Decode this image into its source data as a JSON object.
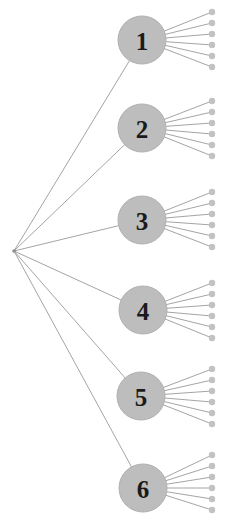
{
  "figure": {
    "name": "hierarchical-tree-diagram",
    "type": "tree",
    "width": 241,
    "height": 532,
    "background_color": "#ffffff"
  },
  "style": {
    "node_fill": "#bdbdbd",
    "node_stroke": "#b0b0b0",
    "node_radius": 24,
    "node_label_color": "#1a1a1a",
    "edge_color": "#9a9a9a",
    "edge_width": 0.9,
    "leaf_fill": "#c2c2c2",
    "leaf_radius": 3.2,
    "root_fill": "#8f8f8f",
    "root_radius": 1.8
  },
  "root": {
    "id": "root",
    "label": "",
    "x": 14,
    "y": 251
  },
  "nodes": [
    {
      "id": "n1",
      "label": "1",
      "x": 142,
      "y": 40,
      "leaf_count": 6
    },
    {
      "id": "n2",
      "label": "2",
      "x": 142,
      "y": 128,
      "leaf_count": 6
    },
    {
      "id": "n3",
      "label": "3",
      "x": 142,
      "y": 220,
      "leaf_count": 6
    },
    {
      "id": "n4",
      "label": "4",
      "x": 143,
      "y": 310,
      "leaf_count": 6
    },
    {
      "id": "n5",
      "label": "5",
      "x": 141,
      "y": 396,
      "leaf_count": 6
    },
    {
      "id": "n6",
      "label": "6",
      "x": 143,
      "y": 488,
      "leaf_count": 6
    }
  ],
  "leaves": {
    "x": 212,
    "spread": 28,
    "clusters": [
      {
        "parent": "n1",
        "cy": 40,
        "ys": [
          12,
          23,
          34,
          45,
          56,
          67
        ]
      },
      {
        "parent": "n2",
        "cy": 128,
        "ys": [
          101,
          112,
          123,
          134,
          145,
          156
        ]
      },
      {
        "parent": "n3",
        "cy": 220,
        "ys": [
          192,
          203,
          214,
          225,
          236,
          247
        ]
      },
      {
        "parent": "n4",
        "cy": 310,
        "ys": [
          283,
          294,
          305,
          316,
          327,
          338
        ]
      },
      {
        "parent": "n5",
        "cy": 396,
        "ys": [
          369,
          380,
          391,
          402,
          413,
          424
        ]
      },
      {
        "parent": "n6",
        "cy": 488,
        "ys": [
          455,
          466,
          477,
          488,
          499,
          510
        ]
      }
    ]
  }
}
